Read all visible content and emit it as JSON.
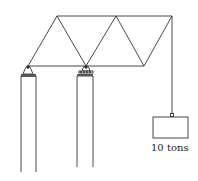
{
  "diagram": {
    "type": "truss-on-columns",
    "load": {
      "label": "10 tons",
      "value": 10,
      "unit": "tons"
    },
    "supports": [
      {
        "name": "left-column",
        "support_type": "pin"
      },
      {
        "name": "right-column",
        "support_type": "roller"
      }
    ],
    "colors": {
      "line": "#333333",
      "background": "#ffffff"
    }
  }
}
